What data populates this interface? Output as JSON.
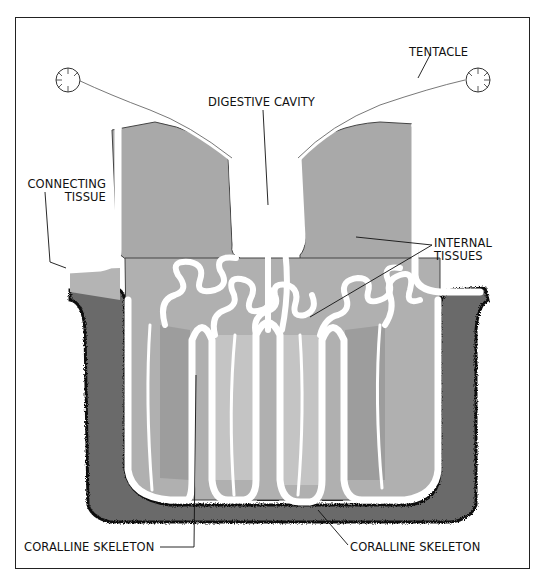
{
  "diagram": {
    "labels": {
      "tentacle": "TENTACLE",
      "digestive_cavity": "DIGESTIVE CAVITY",
      "connecting_tissue_line1": "CONNECTING",
      "connecting_tissue_line2": "TISSUE",
      "internal_tissues_line1": "INTERNAL",
      "internal_tissues_line2": "TISSUES",
      "coralline_skeleton_left": "CORALLINE SKELETON",
      "coralline_skeleton_right": "CORALLINE SKELETON"
    },
    "colors": {
      "background": "#ffffff",
      "tissue_fill": "#a9a9a9",
      "tissue_light": "#bdbdbd",
      "skeleton_fill": "#6b6b6b",
      "skeleton_edge": "#111111",
      "membrane": "#ffffff",
      "outline": "#333333"
    }
  }
}
